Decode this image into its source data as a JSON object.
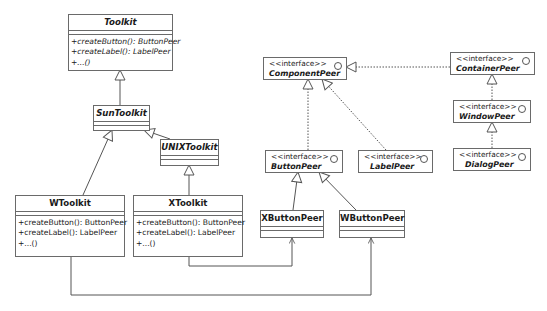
{
  "diagram": {
    "type": "UML class diagram",
    "classes": {
      "toolkit": {
        "name": "Toolkit",
        "operations": [
          "+createButton(): ButtonPeer",
          "+createLabel(): LabelPeer",
          "+...()"
        ]
      },
      "sun_toolkit": {
        "name": "SunToolkit"
      },
      "unix_toolkit": {
        "name": "UNIXToolkit"
      },
      "w_toolkit": {
        "name": "WToolkit",
        "operations": [
          "+createButton(): ButtonPeer",
          "+createLabel(): LabelPeer",
          "+...()"
        ]
      },
      "x_toolkit": {
        "name": "XToolkit",
        "operations": [
          "+createButton(): ButtonPeer",
          "+createLabel(): LabelPeer",
          "+...()"
        ]
      },
      "x_button_peer": {
        "name": "XButtonPeer"
      },
      "w_button_peer": {
        "name": "WButtonPeer"
      }
    },
    "interfaces": {
      "stereotype": "<<interface>>",
      "component_peer": {
        "name": "ComponentPeer"
      },
      "container_peer": {
        "name": "ContainerPeer"
      },
      "window_peer": {
        "name": "WindowPeer"
      },
      "dialog_peer": {
        "name": "DialogPeer"
      },
      "button_peer": {
        "name": "ButtonPeer"
      },
      "label_peer": {
        "name": "LabelPeer"
      }
    },
    "relationships": [
      {
        "from": "SunToolkit",
        "to": "Toolkit",
        "kind": "generalization"
      },
      {
        "from": "UNIXToolkit",
        "to": "SunToolkit",
        "kind": "generalization"
      },
      {
        "from": "WToolkit",
        "to": "SunToolkit",
        "kind": "generalization"
      },
      {
        "from": "XToolkit",
        "to": "UNIXToolkit",
        "kind": "generalization"
      },
      {
        "from": "ContainerPeer",
        "to": "ComponentPeer",
        "kind": "realization"
      },
      {
        "from": "WindowPeer",
        "to": "ContainerPeer",
        "kind": "realization"
      },
      {
        "from": "DialogPeer",
        "to": "WindowPeer",
        "kind": "realization"
      },
      {
        "from": "ButtonPeer",
        "to": "ComponentPeer",
        "kind": "realization"
      },
      {
        "from": "LabelPeer",
        "to": "ComponentPeer",
        "kind": "realization"
      },
      {
        "from": "XButtonPeer",
        "to": "ButtonPeer",
        "kind": "generalization"
      },
      {
        "from": "WButtonPeer",
        "to": "ButtonPeer",
        "kind": "generalization"
      },
      {
        "from": "XToolkit",
        "to": "XButtonPeer",
        "kind": "dependency"
      },
      {
        "from": "WToolkit",
        "to": "WButtonPeer",
        "kind": "dependency"
      }
    ],
    "colors": {
      "line": "#555555",
      "border": "#6a6a6a",
      "background": "#ffffff"
    }
  }
}
